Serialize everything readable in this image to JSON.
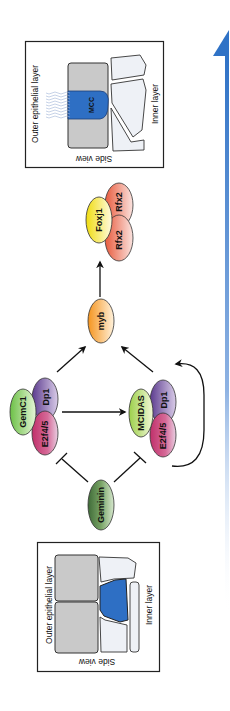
{
  "diagram": {
    "orientation": "rotated-90-clockwise",
    "top_panel": {
      "outer_label": "Outer epithelial layer",
      "inner_label": "Inner layer",
      "view_label": "Side view",
      "cell_label": "MCC"
    },
    "bottom_panel": {
      "outer_label": "Outer epithelial layer",
      "inner_label": "Inner layer",
      "view_label": "Side view"
    },
    "nodes": {
      "geminin": "Geminin",
      "gemc1": "GemC1",
      "dp1_a": "Dp1",
      "e2f_a": "E2f4/5",
      "mcidas": "MCIDAS",
      "dp1_b": "Dp1",
      "e2f_b": "E2f4/5",
      "myb": "myb",
      "foxj1": "Foxj1",
      "rfx2_a": "Rfx2",
      "rfx2_b": "Rfx2"
    },
    "colors": {
      "mcc_blue": "#2e6fc4",
      "arrow_blue": "#2f72c6",
      "outer_gray": "#c8c8c8",
      "inner_white": "#eef1f6",
      "geminin_green": "#5e8a50",
      "gemc1_green": "#8fd36a",
      "dp1_purple": "#7a5aa8",
      "e2f_pink": "#d0457a",
      "mcidas_green": "#b3dc6a",
      "myb_orange": "#f5a030",
      "foxj1_yellow": "#f4e030",
      "rfx2_red": "#e05a4a"
    }
  }
}
